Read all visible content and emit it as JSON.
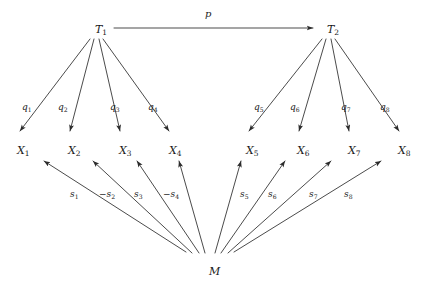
{
  "figure": {
    "type": "path-diagram",
    "background_color": "#ffffff",
    "line_color": "#2b2b2b",
    "text_color": "#1a1a1a"
  },
  "nodes": {
    "trait_factors": [
      {
        "id": "T1",
        "base": "T",
        "sub": "1",
        "x": 95,
        "y": 24
      },
      {
        "id": "T2",
        "base": "T",
        "sub": "2",
        "x": 327,
        "y": 24
      }
    ],
    "method_factor": {
      "id": "M",
      "base": "M",
      "sub": "",
      "x": 209,
      "y": 266
    },
    "indicators": [
      {
        "id": "X1",
        "base": "X",
        "sub": "1",
        "x": 17,
        "y": 145
      },
      {
        "id": "X2",
        "base": "X",
        "sub": "2",
        "x": 68,
        "y": 145
      },
      {
        "id": "X3",
        "base": "X",
        "sub": "3",
        "x": 119,
        "y": 145
      },
      {
        "id": "X4",
        "base": "X",
        "sub": "4",
        "x": 169,
        "y": 145
      },
      {
        "id": "X5",
        "base": "X",
        "sub": "5",
        "x": 246,
        "y": 145
      },
      {
        "id": "X6",
        "base": "X",
        "sub": "6",
        "x": 297,
        "y": 145
      },
      {
        "id": "X7",
        "base": "X",
        "sub": "7",
        "x": 348,
        "y": 145
      },
      {
        "id": "X8",
        "base": "X",
        "sub": "8",
        "x": 398,
        "y": 145
      }
    ]
  },
  "edges": {
    "structural_path": {
      "id": "p",
      "from": "T1",
      "to": "T2",
      "label_base": "p",
      "label_sub": "",
      "label_x": 205,
      "label_y": 9
    },
    "trait_loadings": [
      {
        "id": "q1",
        "from": "T1",
        "to": "X1",
        "base": "q",
        "sub": "1",
        "sign": "",
        "label_x": 22,
        "label_y": 103
      },
      {
        "id": "q2",
        "from": "T1",
        "to": "X2",
        "base": "q",
        "sub": "2",
        "sign": "",
        "label_x": 58,
        "label_y": 103
      },
      {
        "id": "q3",
        "from": "T1",
        "to": "X3",
        "base": "q",
        "sub": "3",
        "sign": "",
        "label_x": 110,
        "label_y": 103
      },
      {
        "id": "q4",
        "from": "T1",
        "to": "X4",
        "base": "q",
        "sub": "4",
        "sign": "",
        "label_x": 148,
        "label_y": 103
      },
      {
        "id": "q5",
        "from": "T2",
        "to": "X5",
        "base": "q",
        "sub": "5",
        "sign": "",
        "label_x": 254,
        "label_y": 103
      },
      {
        "id": "q6",
        "from": "T2",
        "to": "X6",
        "base": "q",
        "sub": "6",
        "sign": "",
        "label_x": 290,
        "label_y": 103
      },
      {
        "id": "q7",
        "from": "T2",
        "to": "X7",
        "base": "q",
        "sub": "7",
        "sign": "",
        "label_x": 341,
        "label_y": 103
      },
      {
        "id": "q8",
        "from": "T2",
        "to": "X8",
        "base": "q",
        "sub": "8",
        "sign": "",
        "label_x": 380,
        "label_y": 103
      }
    ],
    "method_loadings": [
      {
        "id": "s1",
        "from": "M",
        "to": "X1",
        "base": "s",
        "sub": "1",
        "sign": "",
        "label_x": 70,
        "label_y": 190
      },
      {
        "id": "s2",
        "from": "M",
        "to": "X2",
        "base": "s",
        "sub": "2",
        "sign": "−",
        "label_x": 99,
        "label_y": 190
      },
      {
        "id": "s3",
        "from": "M",
        "to": "X3",
        "base": "s",
        "sub": "3",
        "sign": "",
        "label_x": 134,
        "label_y": 190
      },
      {
        "id": "s4",
        "from": "M",
        "to": "X4",
        "base": "s",
        "sub": "4",
        "sign": "−",
        "label_x": 163,
        "label_y": 190
      },
      {
        "id": "s5",
        "from": "M",
        "to": "X5",
        "base": "s",
        "sub": "5",
        "sign": "",
        "label_x": 240,
        "label_y": 190
      },
      {
        "id": "s6",
        "from": "M",
        "to": "X6",
        "base": "s",
        "sub": "6",
        "sign": "",
        "label_x": 268,
        "label_y": 190
      },
      {
        "id": "s7",
        "from": "M",
        "to": "X7",
        "base": "s",
        "sub": "7",
        "sign": "",
        "label_x": 309,
        "label_y": 190
      },
      {
        "id": "s8",
        "from": "M",
        "to": "X8",
        "base": "s",
        "sub": "8",
        "sign": "",
        "label_x": 344,
        "label_y": 190
      }
    ]
  },
  "geometry": {
    "t1_fan_origin": {
      "x": 96,
      "y": 38
    },
    "t2_fan_origin": {
      "x": 328,
      "y": 38
    },
    "m_fan_origin": {
      "x": 210,
      "y": 254
    },
    "structural_arrow": {
      "x1": 114,
      "y1": 28,
      "x2": 315,
      "y2": 28
    },
    "indicator_arrow_tips": [
      {
        "x": 18,
        "y": 134
      },
      {
        "x": 70,
        "y": 134
      },
      {
        "x": 120,
        "y": 134
      },
      {
        "x": 170,
        "y": 134
      },
      {
        "x": 247,
        "y": 134
      },
      {
        "x": 298,
        "y": 134
      },
      {
        "x": 349,
        "y": 134
      },
      {
        "x": 399,
        "y": 134
      }
    ],
    "method_arrow_tips": [
      {
        "x": 42,
        "y": 163
      },
      {
        "x": 92,
        "y": 163
      },
      {
        "x": 136,
        "y": 163
      },
      {
        "x": 178,
        "y": 163
      },
      {
        "x": 240,
        "y": 163
      },
      {
        "x": 284,
        "y": 163
      },
      {
        "x": 330,
        "y": 163
      },
      {
        "x": 380,
        "y": 163
      }
    ],
    "method_fan_tails": [
      {
        "x": 178,
        "y": 252
      },
      {
        "x": 186,
        "y": 252
      },
      {
        "x": 196,
        "y": 253
      },
      {
        "x": 204,
        "y": 253
      },
      {
        "x": 214,
        "y": 253
      },
      {
        "x": 222,
        "y": 253
      },
      {
        "x": 232,
        "y": 252
      },
      {
        "x": 242,
        "y": 252
      }
    ]
  }
}
